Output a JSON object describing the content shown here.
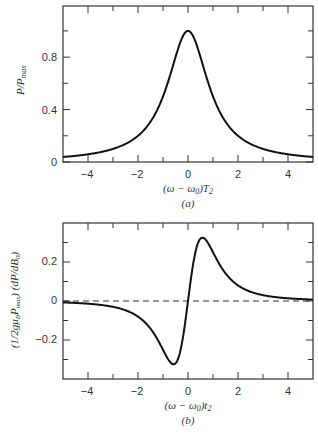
{
  "chart_data": [
    {
      "type": "line",
      "panel": "(a)",
      "title": "",
      "xlabel": "(ω − ω₀)T₂",
      "ylabel": "P/Pmax",
      "xlim": [
        -5,
        5
      ],
      "ylim": [
        0,
        1.19
      ],
      "xticks": [
        -4,
        -2,
        0,
        2,
        4
      ],
      "xminor_ticks": [
        -3,
        -1,
        1,
        3
      ],
      "yticks": [
        0,
        0.4,
        0.8
      ],
      "yminor_ticks": [
        0.2,
        0.6,
        1.0
      ],
      "ytick_labels": [
        "0",
        "0.4",
        "0.8"
      ],
      "grid": false,
      "legend": null,
      "series": [
        {
          "name": "Lorentzian absorption",
          "x": [
            -5,
            -4.5,
            -4,
            -3.5,
            -3,
            -2.5,
            -2,
            -1.5,
            -1,
            -0.5,
            0,
            0.5,
            1,
            1.5,
            2,
            2.5,
            3,
            3.5,
            4,
            4.5,
            5
          ],
          "values": [
            0.038,
            0.047,
            0.059,
            0.075,
            0.1,
            0.138,
            0.2,
            0.308,
            0.5,
            0.8,
            1.0,
            0.8,
            0.5,
            0.308,
            0.2,
            0.138,
            0.1,
            0.075,
            0.059,
            0.047,
            0.038
          ]
        }
      ]
    },
    {
      "type": "line",
      "panel": "(b)",
      "title": "",
      "xlabel": "(ω − ω₀)t₂",
      "ylabel": "(1/2gμB Pmax) (dP/dB₀)",
      "xlim": [
        -5,
        5
      ],
      "ylim": [
        -0.4,
        0.4
      ],
      "xticks": [
        -4,
        -2,
        0,
        2,
        4
      ],
      "xminor_ticks": [
        -3,
        -1,
        1,
        3
      ],
      "yticks": [
        -0.2,
        0,
        0.2
      ],
      "yminor_ticks": [
        -0.3,
        -0.1,
        0.1,
        0.3
      ],
      "ytick_labels": [
        "−0.2",
        "0",
        "0.2"
      ],
      "grid": false,
      "legend": null,
      "reference_line": {
        "y": 0,
        "style": "dashed"
      },
      "series": [
        {
          "name": "Derivative of absorption",
          "x": [
            -5,
            -4.5,
            -4,
            -3.5,
            -3,
            -2.5,
            -2,
            -1.5,
            -1,
            -0.577,
            -0.5,
            0,
            0.5,
            0.577,
            1,
            1.5,
            2,
            2.5,
            3,
            3.5,
            4,
            4.5,
            5
          ],
          "values": [
            -0.007,
            -0.01,
            -0.014,
            -0.02,
            -0.03,
            -0.048,
            -0.08,
            -0.142,
            -0.25,
            -0.325,
            -0.32,
            0,
            0.32,
            0.325,
            0.25,
            0.142,
            0.08,
            0.048,
            0.03,
            0.02,
            0.014,
            0.01,
            0.007
          ]
        }
      ]
    }
  ],
  "labels": {
    "a": {
      "ylabel_main": "P/P",
      "ylabel_sub": "max",
      "xlabel": "(ω − ω",
      "xlabel_sub0": "0",
      "xlabel_tail": ")T",
      "xlabel_sub2": "2",
      "panel": "(a)",
      "xtick_labels": [
        "−4",
        "−2",
        "0",
        "2",
        "4"
      ],
      "ytick_labels": [
        "0",
        "0.4",
        "0.8"
      ]
    },
    "b": {
      "ylabel_1": "(1/2gμ",
      "ylabel_B": "B",
      "ylabel_P": "P",
      "ylabel_max": "max",
      "ylabel_2": ") (dP/dB",
      "ylabel_0": "0",
      "ylabel_3": ")",
      "xlabel": "(ω − ω",
      "xlabel_sub0": "0",
      "xlabel_tail": ")t",
      "xlabel_sub2": "2",
      "panel": "(b)",
      "xtick_labels": [
        "−4",
        "−2",
        "0",
        "2",
        "4"
      ],
      "ytick_labels": [
        "0.2",
        "0",
        "−0.2"
      ]
    }
  },
  "colors": {
    "line": "#111111",
    "axes": "#333333",
    "text": "#333333"
  }
}
